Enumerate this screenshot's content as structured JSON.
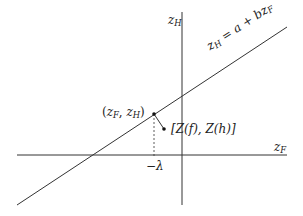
{
  "diagram": {
    "type": "coordinate-plot",
    "colors": {
      "line": "#333333",
      "text": "#222222",
      "background": "#ffffff"
    },
    "axes": {
      "x_label": {
        "base": "z",
        "sub": "F"
      },
      "y_label": {
        "base": "z",
        "sub": "H"
      }
    },
    "line_label": {
      "lhs_base": "z",
      "lhs_sub": "H",
      "eq": " = a + b",
      "rhs_base": "z",
      "rhs_sub": "F"
    },
    "point_on_line": {
      "open": "(",
      "a_base": "z",
      "a_sub": "F",
      "comma": ", ",
      "b_base": "z",
      "b_sub": "H",
      "close": ")"
    },
    "observed_point": {
      "text": "[Z(f), Z(h)]"
    },
    "tick_label": "−λ"
  }
}
